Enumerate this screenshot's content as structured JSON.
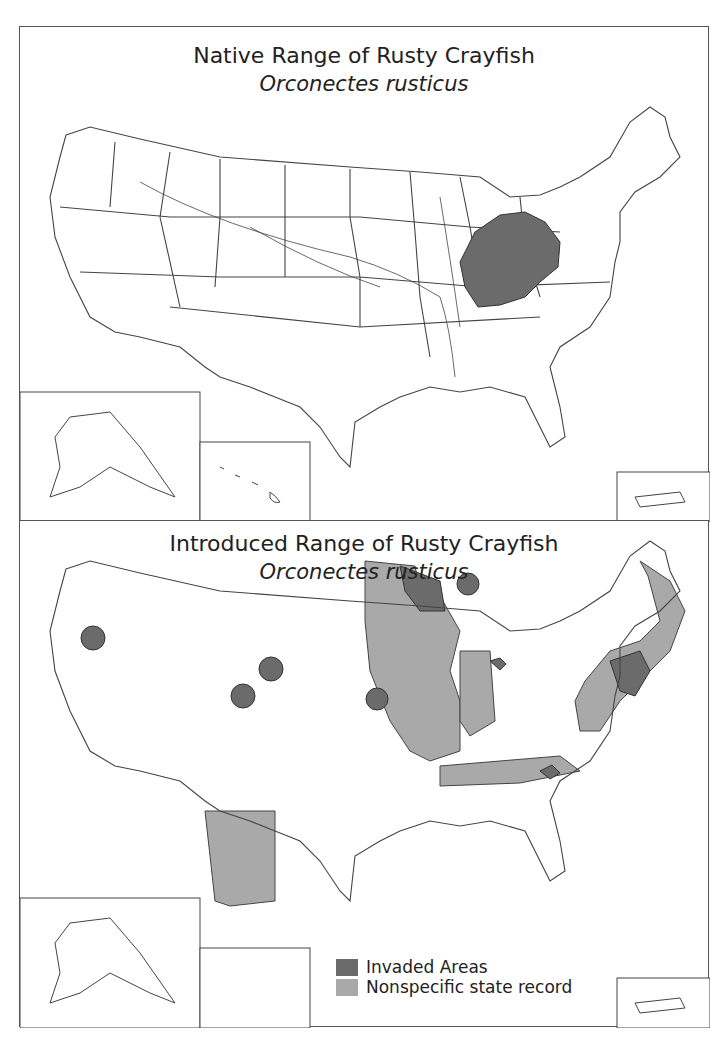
{
  "maps": [
    {
      "title": "Native Range of Rusty Crayfish",
      "subtitle": "Orconectes rusticus"
    },
    {
      "title": "Introduced Range of Rusty Crayfish",
      "subtitle": "Orconectes rusticus",
      "legend": [
        {
          "label": "Invaded Areas",
          "color": "#6b6b6b"
        },
        {
          "label": "Nonspecific state record",
          "color": "#a9a9a9"
        }
      ]
    }
  ],
  "colors": {
    "invaded": "#6b6b6b",
    "nonspecific": "#a9a9a9",
    "outline": "#444444"
  }
}
